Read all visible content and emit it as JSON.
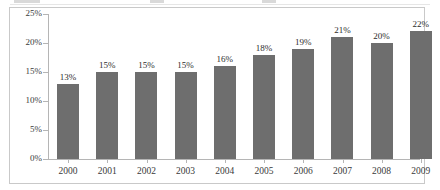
{
  "chart_data": {
    "type": "bar",
    "title": "",
    "subtitle": "",
    "xlabel": "",
    "ylabel": "",
    "categories": [
      "2000",
      "2001",
      "2002",
      "2003",
      "2004",
      "2005",
      "2006",
      "2007",
      "2008",
      "2009"
    ],
    "values": [
      13,
      15,
      15,
      15,
      16,
      18,
      19,
      21,
      20,
      22
    ],
    "data_labels": [
      "13%",
      "15%",
      "15%",
      "15%",
      "16%",
      "18%",
      "19%",
      "21%",
      "20%",
      "22%"
    ],
    "ylim": [
      0,
      25
    ],
    "yticks": [
      0,
      5,
      10,
      15,
      20,
      25
    ],
    "ytick_labels": [
      "0%",
      "5%",
      "10%",
      "15%",
      "20%",
      "25%"
    ],
    "grid": false,
    "legend": "none",
    "series": [
      {
        "name": "",
        "values": [
          13,
          15,
          15,
          15,
          16,
          18,
          19,
          21,
          20,
          22
        ],
        "color": "#6e6e6e"
      }
    ]
  },
  "style": {
    "bar_color": "#6e6e6e",
    "axis_color": "#b5b5b5",
    "frame_color": "#c9c9c9",
    "text_color": "#3a3a3a",
    "background": "#ffffff"
  }
}
